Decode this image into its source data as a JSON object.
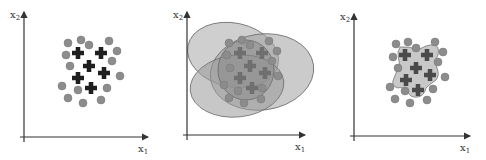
{
  "panels": [
    {
      "id": "panel-1",
      "title": "",
      "x_label": "x",
      "x_sub": "1",
      "y_label": "x",
      "y_sub": "2",
      "origin": [
        24,
        137
      ],
      "x_end": 148,
      "y_top": 12,
      "circles": [
        [
          68,
          43
        ],
        [
          81,
          40
        ],
        [
          89,
          45
        ],
        [
          109,
          41
        ],
        [
          117,
          51
        ],
        [
          66,
          55
        ],
        [
          70,
          66
        ],
        [
          112,
          61
        ],
        [
          120,
          76
        ],
        [
          62,
          86
        ],
        [
          78,
          90
        ],
        [
          107,
          88
        ],
        [
          68,
          98
        ],
        [
          83,
          103
        ],
        [
          101,
          100
        ]
      ],
      "crosses": [
        [
          78,
          53
        ],
        [
          101,
          53
        ],
        [
          89,
          66
        ],
        [
          104,
          73
        ],
        [
          78,
          78
        ],
        [
          91,
          88
        ]
      ],
      "regions": []
    },
    {
      "id": "panel-2",
      "x_label": "x",
      "x_sub": "1",
      "y_label": "x",
      "y_sub": "2",
      "origin": [
        187,
        135
      ],
      "x_end": 305,
      "y_top": 12,
      "circles": [
        [
          229,
          43
        ],
        [
          242,
          40
        ],
        [
          250,
          45
        ],
        [
          269,
          41
        ],
        [
          277,
          51
        ],
        [
          227,
          55
        ],
        [
          230,
          68
        ],
        [
          272,
          61
        ],
        [
          278,
          76
        ],
        [
          224,
          85
        ],
        [
          238,
          91
        ],
        [
          262,
          88
        ],
        [
          229,
          98
        ],
        [
          244,
          103
        ],
        [
          261,
          99
        ]
      ],
      "crosses": [
        [
          240,
          53
        ],
        [
          262,
          53
        ],
        [
          250,
          66
        ],
        [
          265,
          73
        ],
        [
          240,
          78
        ],
        [
          252,
          88
        ]
      ],
      "regions": [
        {
          "type": "ellipse",
          "cx": 233,
          "cy": 55,
          "rx": 46,
          "ry": 32,
          "rot": 12,
          "fill": "#a8a8a8"
        },
        {
          "type": "ellipse",
          "cx": 262,
          "cy": 72,
          "rx": 52,
          "ry": 38,
          "rot": -8,
          "fill": "#a0a0a0"
        },
        {
          "type": "ellipse",
          "cx": 237,
          "cy": 86,
          "rx": 47,
          "ry": 31,
          "rot": -6,
          "fill": "#999999"
        },
        {
          "type": "ellipse",
          "cx": 246,
          "cy": 70,
          "rx": 28,
          "ry": 30,
          "rot": 0,
          "fill": "#8a8a8a"
        }
      ]
    },
    {
      "id": "panel-3",
      "x_label": "x",
      "x_sub": "1",
      "y_label": "x",
      "y_sub": "2",
      "origin": [
        354,
        136
      ],
      "x_end": 470,
      "y_top": 14,
      "circles": [
        [
          396,
          44
        ],
        [
          408,
          42
        ],
        [
          416,
          48
        ],
        [
          435,
          42
        ],
        [
          443,
          52
        ],
        [
          393,
          57
        ],
        [
          398,
          68
        ],
        [
          438,
          62
        ],
        [
          445,
          77
        ],
        [
          390,
          87
        ],
        [
          405,
          91
        ],
        [
          433,
          89
        ],
        [
          395,
          99
        ],
        [
          410,
          103
        ],
        [
          427,
          100
        ]
      ],
      "crosses": [
        [
          405,
          55
        ],
        [
          427,
          55
        ],
        [
          416,
          68
        ],
        [
          430,
          75
        ],
        [
          406,
          80
        ],
        [
          418,
          90
        ]
      ],
      "regions": [
        {
          "type": "blob",
          "path": "M400,47 Q410,46 418,50 Q428,44 434,45 Q440,46 438,55 Q434,62 437,68 Q440,75 436,80 Q430,84 426,88 Q424,96 418,97 Q410,98 408,92 Q402,86 398,88 Q390,86 394,78 Q396,72 400,66 Q398,58 398,52 Z",
          "fill": "#c8c8c8"
        }
      ]
    }
  ],
  "colors": {
    "circle": "#8c8c8c",
    "circle_stroke": "#777777",
    "cross": "#1e1e1e",
    "cross_in_region": "#4a4a4a",
    "axis": "#333333"
  }
}
